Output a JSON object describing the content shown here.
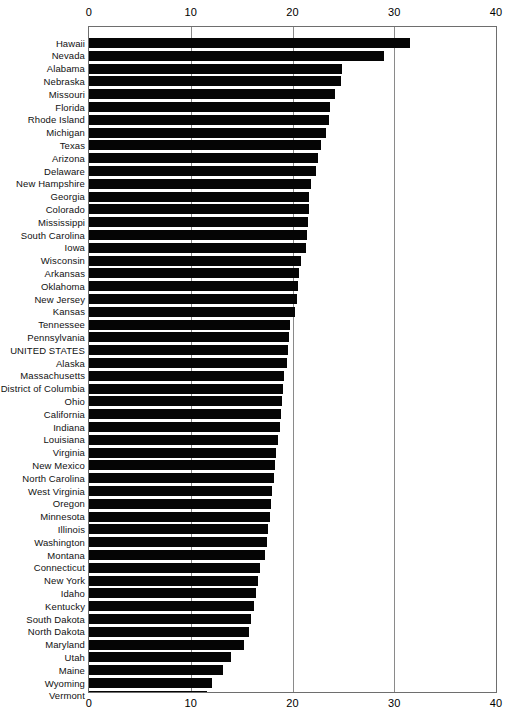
{
  "chart_data": {
    "type": "bar",
    "orientation": "horizontal",
    "title": "",
    "subtitle": "",
    "xlabel": "",
    "ylabel": "",
    "xlim": [
      0,
      40
    ],
    "xticks": [
      0,
      10,
      20,
      30,
      40
    ],
    "xtick_labels": [
      "0",
      "10",
      "20",
      "30",
      "40"
    ],
    "grid": true,
    "grid_axis": "x",
    "legend": false,
    "axis_labels_position": "top-and-bottom",
    "bar_color": "#050505",
    "categories": [
      "Hawaii",
      "Nevada",
      "Alabama",
      "Nebraska",
      "Missouri",
      "Florida",
      "Rhode Island",
      "Michigan",
      "Texas",
      "Arizona",
      "Delaware",
      "New Hampshire",
      "Georgia",
      "Colorado",
      "Mississippi",
      "South Carolina",
      "Iowa",
      "Wisconsin",
      "Arkansas",
      "Oklahoma",
      "New Jersey",
      "Kansas",
      "Tennessee",
      "Pennsylvania",
      "UNITED STATES",
      "Alaska",
      "Massachusetts",
      "District of Columbia",
      "Ohio",
      "California",
      "Indiana",
      "Louisiana",
      "Virginia",
      "New Mexico",
      "North Carolina",
      "West Virginia",
      "Oregon",
      "Minnesota",
      "Illinois",
      "Washington",
      "Montana",
      "Connecticut",
      "New York",
      "Idaho",
      "Kentucky",
      "South Dakota",
      "North Dakota",
      "Maryland",
      "Utah",
      "Maine",
      "Wyoming",
      "Vermont"
    ],
    "values": [
      31.5,
      29.0,
      24.9,
      24.8,
      24.2,
      23.7,
      23.6,
      23.3,
      22.8,
      22.5,
      22.3,
      21.8,
      21.6,
      21.6,
      21.5,
      21.4,
      21.3,
      20.8,
      20.6,
      20.5,
      20.4,
      20.2,
      19.8,
      19.7,
      19.6,
      19.5,
      19.2,
      19.1,
      19.0,
      18.9,
      18.8,
      18.6,
      18.4,
      18.3,
      18.2,
      18.0,
      17.9,
      17.8,
      17.6,
      17.5,
      17.3,
      16.8,
      16.6,
      16.4,
      16.2,
      15.9,
      15.7,
      15.2,
      14.0,
      13.2,
      12.1,
      11.6
    ]
  }
}
